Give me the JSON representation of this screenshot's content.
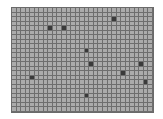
{
  "game": {
    "name": "grid-board",
    "columns": 31,
    "rows": 23,
    "colors": {
      "cell": "#ababab",
      "grid_line": "#6e6e6e",
      "marked": "#3a3a3a"
    },
    "marked_cells": [
      {
        "col": 8,
        "row": 4
      },
      {
        "col": 11,
        "row": 4
      },
      {
        "col": 22,
        "row": 2
      },
      {
        "col": 16,
        "row": 9
      },
      {
        "col": 17,
        "row": 12
      },
      {
        "col": 28,
        "row": 12
      },
      {
        "col": 24,
        "row": 14
      },
      {
        "col": 4,
        "row": 15
      },
      {
        "col": 29,
        "row": 16
      },
      {
        "col": 16,
        "row": 19
      }
    ]
  }
}
